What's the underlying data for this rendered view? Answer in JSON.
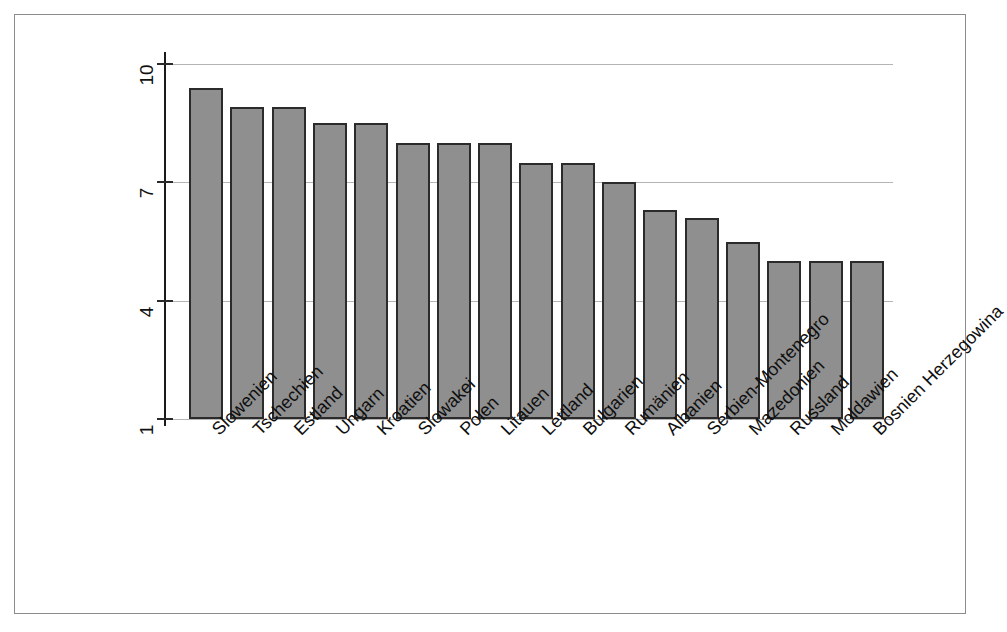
{
  "figure": {
    "title": "",
    "background": "#ffffff",
    "frame_color": "#8c8c8c",
    "bar_fill": "#8f8f8f",
    "bar_stroke": "#2b2b2b",
    "grid_color": "#b4b4b4",
    "axis_color": "#1a1a1a"
  },
  "chart_data": {
    "type": "bar",
    "title": "",
    "xlabel": "",
    "ylabel": "",
    "ylim": [
      1,
      10
    ],
    "yticks": [
      10,
      7,
      4,
      1
    ],
    "grid": true,
    "legend": false,
    "orientation": "vertical",
    "xtick_rotation": -45,
    "ytick_rotation": -90,
    "categories": [
      "Slowenien",
      "Tschechien",
      "Estland",
      "Ungarn",
      "Kroatien",
      "Slowakei",
      "Polen",
      "Litauen",
      "Lettland",
      "Bulgarien",
      "Rumänien",
      "Albanien",
      "Serbien-Montenegro",
      "Mazedonien",
      "Russland",
      "Moldawien",
      "Bosnien Herzegowina"
    ],
    "values": [
      9.4,
      8.9,
      8.9,
      8.5,
      8.5,
      8.0,
      8.0,
      8.0,
      7.5,
      7.5,
      7.0,
      6.3,
      6.1,
      5.5,
      5.0,
      5.0,
      5.0
    ]
  }
}
